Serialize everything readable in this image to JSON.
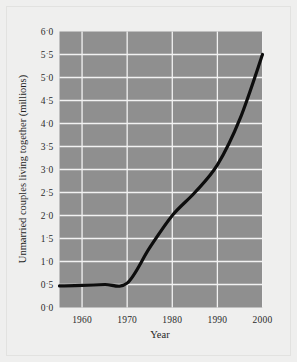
{
  "chart_data": {
    "type": "line",
    "title": "",
    "xlabel": "Year",
    "ylabel": "Unmarried couples living together (millions)",
    "xlim": [
      1955,
      2000
    ],
    "ylim": [
      0.0,
      6.0
    ],
    "grid": true,
    "legend": null,
    "x_tick_labels": [
      "1960",
      "1970",
      "1980",
      "1990",
      "2000"
    ],
    "x_ticks": [
      1960,
      1970,
      1980,
      1990,
      2000
    ],
    "y_ticks": [
      0.0,
      0.5,
      1.0,
      1.5,
      2.0,
      2.5,
      3.0,
      3.5,
      4.0,
      4.5,
      5.0,
      5.5,
      6.0
    ],
    "y_tick_labels": [
      "0.0",
      "0.5",
      "1.0",
      "1.5",
      "2.0",
      "2.5",
      "3.0",
      "3.5",
      "4.0",
      "4.5",
      "5.0",
      "5.5",
      "6.0"
    ],
    "series": [
      {
        "name": "Unmarried couples living together",
        "x": [
          1955,
          1960,
          1965,
          1970,
          1975,
          1980,
          1985,
          1990,
          1995,
          2000
        ],
        "values": [
          0.47,
          0.48,
          0.5,
          0.53,
          1.3,
          2.0,
          2.5,
          3.1,
          4.1,
          5.5
        ]
      }
    ]
  },
  "style": {
    "plot_background": "#8f8f8f",
    "grid_color": "#f2f2f2",
    "line_color": "#0d0d0d",
    "page_background": "#efefee",
    "text_color": "#2b2b2b"
  }
}
